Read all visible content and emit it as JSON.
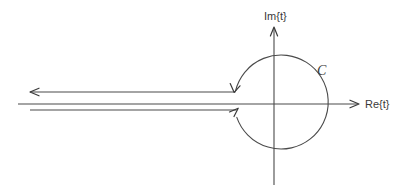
{
  "figure": {
    "background_color": "#ffffff",
    "line_color": "#4a4a4a",
    "label_color": "#3a3a3a",
    "width": 403,
    "height": 194
  },
  "axes": {
    "real": {
      "label": "Re{t}",
      "label_x": 365,
      "label_y": 108,
      "y": 104,
      "x_start": 18,
      "x_end": 360,
      "arrow": "right"
    },
    "imaginary": {
      "label": "Im{t}",
      "label_x": 264,
      "label_y": 20,
      "x": 274,
      "y_start": 27,
      "y_end": 185,
      "arrow": "up"
    }
  },
  "contour": {
    "curve_label": "C",
    "curve_label_x": 317,
    "curve_label_y": 75,
    "circle": {
      "center_x": 277,
      "center_y": 104,
      "radius": 47
    },
    "upper_branch": {
      "y": 92,
      "x_left": 30,
      "x_right": 235,
      "direction": "leftward"
    },
    "lower_branch": {
      "y": 110,
      "x_left": 30,
      "x_right": 237,
      "direction": "rightward"
    },
    "arrowheads": [
      {
        "name": "upper-line-left-arrow",
        "x": 30,
        "y": 92,
        "direction": "left"
      },
      {
        "name": "upper-branch-entry-arrow",
        "x": 234,
        "y": 92,
        "direction": "down"
      },
      {
        "name": "lower-branch-exit-arrow",
        "x": 237,
        "y": 109,
        "direction": "up-right"
      }
    ]
  }
}
